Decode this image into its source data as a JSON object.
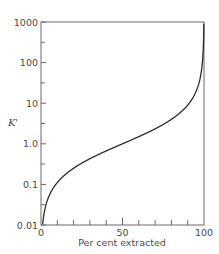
{
  "chart_data": {
    "type": "line",
    "title": "",
    "xlabel": "Per cent extracted",
    "ylabel": "K'",
    "xlim": [
      0,
      100
    ],
    "ylim": [
      0.01,
      1000
    ],
    "yscale": "log",
    "grid": false,
    "legend": null,
    "x_ticks": [
      0,
      10,
      20,
      30,
      40,
      50,
      60,
      70,
      80,
      90,
      100
    ],
    "x_tick_labels": [
      "0",
      "50",
      "100"
    ],
    "y_tick_labels": [
      "0.01",
      "0.1",
      "1.0",
      "10",
      "100",
      "1000"
    ],
    "series": [
      {
        "name": "K' vs per cent extracted",
        "x": [
          1,
          2,
          5,
          10,
          20,
          30,
          40,
          50,
          60,
          70,
          80,
          90,
          95,
          98,
          99,
          99.5,
          99.9
        ],
        "y": [
          0.0101,
          0.0204,
          0.0526,
          0.111,
          0.25,
          0.429,
          0.667,
          1.0,
          1.5,
          2.33,
          4.0,
          9.0,
          19.0,
          49.0,
          99.0,
          199.0,
          999.0
        ]
      }
    ]
  },
  "colors": {
    "axis": "#6a6a6a",
    "curve": "#2a2a2a",
    "text": "#4a4a4a"
  }
}
